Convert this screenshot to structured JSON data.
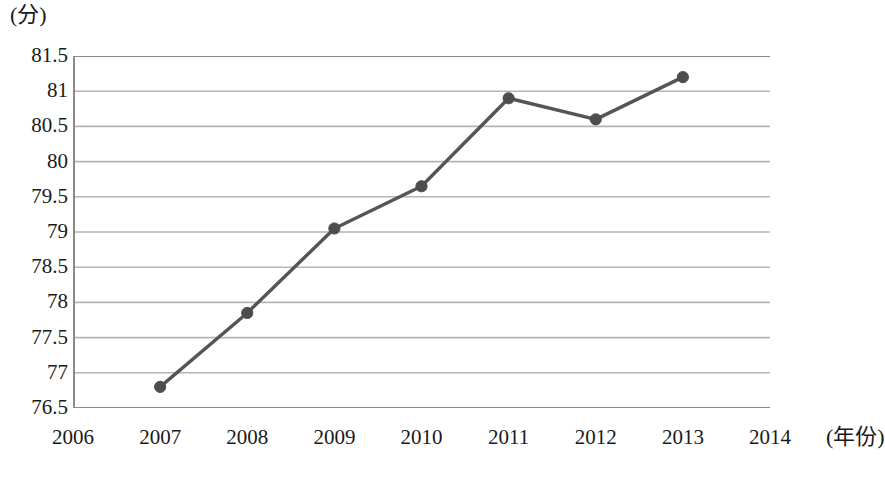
{
  "chart_data": {
    "type": "line",
    "title": "",
    "xlabel": "(年份)",
    "ylabel": "(分)",
    "x": [
      2006,
      2007,
      2008,
      2009,
      2010,
      2011,
      2012,
      2013,
      2014
    ],
    "xtick_labels": [
      "2006",
      "2007",
      "2008",
      "2009",
      "2010",
      "2011",
      "2012",
      "2013",
      "2014"
    ],
    "xlim": [
      2006,
      2014
    ],
    "ylim": [
      76.5,
      81.5
    ],
    "ytick_labels": [
      "81.5",
      "81",
      "80.5",
      "80",
      "79.5",
      "79",
      "78.5",
      "78",
      "77.5",
      "77",
      "76.5"
    ],
    "yticks": [
      81.5,
      81,
      80.5,
      80,
      79.5,
      79,
      78.5,
      78,
      77.5,
      77,
      76.5
    ],
    "grid": true,
    "grid_axis": "y",
    "legend": "none",
    "series": [
      {
        "name": "得分",
        "x": [
          2007,
          2008,
          2009,
          2010,
          2011,
          2012,
          2013
        ],
        "values": [
          76.8,
          77.85,
          79.05,
          79.65,
          80.9,
          80.6,
          81.2
        ],
        "marker": "circle",
        "color": "#555555"
      }
    ],
    "colors": {
      "line": "#555555",
      "marker": "#4d4d4d",
      "grid": "#b5b5b5",
      "axis": "#8a8a8a",
      "text": "#1a1a1a",
      "background": "#ffffff"
    }
  }
}
